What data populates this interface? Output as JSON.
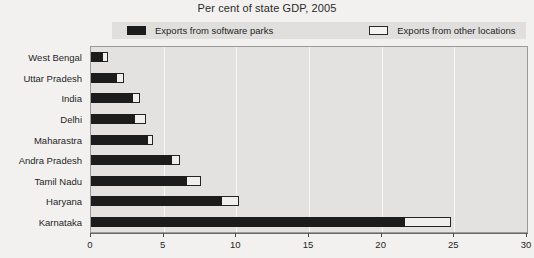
{
  "chart": {
    "title": "Per cent of state GDP, 2005"
  },
  "legend": {
    "entries": [
      {
        "label": "Exports from software parks",
        "swatch": "dark-filled-square",
        "color": "#1c1c1c"
      },
      {
        "label": "Exports from other locations",
        "swatch": "white-outlined-square",
        "color": "#f4f3f1"
      }
    ]
  },
  "axes": {
    "x_ticks": [
      "0",
      "5",
      "10",
      "15",
      "20",
      "25",
      "30"
    ]
  },
  "chart_data": {
    "type": "bar",
    "orientation": "horizontal",
    "stacked": true,
    "title": "Per cent of state GDP, 2005",
    "xlabel": "",
    "ylabel": "",
    "xlim": [
      0,
      30
    ],
    "xticks": [
      0,
      5,
      10,
      15,
      20,
      25,
      30
    ],
    "grid": true,
    "legend_position": "top",
    "categories": [
      "West Bengal",
      "Uttar Pradesh",
      "India",
      "Delhi",
      "Maharastra",
      "Andra Pradesh",
      "Tamil Nadu",
      "Haryana",
      "Karnataka"
    ],
    "series": [
      {
        "name": "Exports from software parks",
        "color": "#1c1c1c",
        "values": [
          0.8,
          1.8,
          2.9,
          3.0,
          3.9,
          5.6,
          6.6,
          9.0,
          21.6
        ]
      },
      {
        "name": "Exports from other locations",
        "color": "#f0efed",
        "values": [
          0.4,
          0.5,
          0.5,
          0.8,
          0.4,
          0.5,
          1.0,
          1.2,
          3.2
        ]
      }
    ],
    "totals": [
      1.2,
      2.3,
      3.4,
      3.8,
      4.3,
      6.1,
      7.6,
      10.2,
      24.8
    ]
  }
}
